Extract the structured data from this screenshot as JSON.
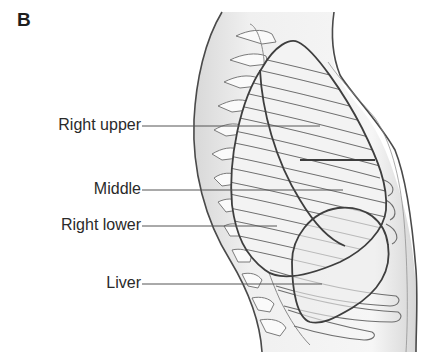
{
  "figure": {
    "panel_letter": "B",
    "labels": [
      {
        "text": "Right upper",
        "y": 126
      },
      {
        "text": "Middle",
        "y": 190
      },
      {
        "text": "Right lower",
        "y": 226
      },
      {
        "text": "Liver",
        "y": 284
      }
    ]
  },
  "colors": {
    "outline": "#4a4a4a",
    "rib": "#6e6e6e",
    "body_fill": "#ececec",
    "lung_fill": "#f4f4f4",
    "leader": "#555555"
  }
}
